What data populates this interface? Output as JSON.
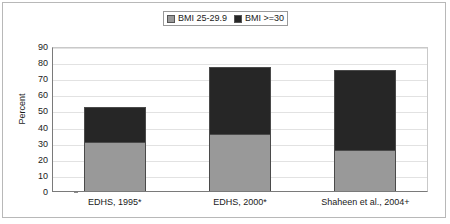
{
  "chart_data": {
    "type": "bar",
    "subtype": "stacked-bar",
    "title": "",
    "xlabel": "",
    "ylabel": "Percent",
    "ylim": [
      0,
      90
    ],
    "yticks": [
      0,
      10,
      20,
      30,
      40,
      50,
      60,
      70,
      80,
      90
    ],
    "grid": true,
    "legend_position": "top-center",
    "categories": [
      "EDHS, 1995*",
      "EDHS, 2000*",
      "Shaheen et al., 2004+"
    ],
    "series": [
      {
        "name": "BMI 25-29.9",
        "color": "#999999",
        "values": [
          31,
          36,
          26
        ]
      },
      {
        "name": "BMI >=30",
        "color": "#262626",
        "values": [
          21,
          41,
          49
        ]
      }
    ],
    "totals": [
      52,
      77,
      75
    ]
  },
  "legend": {
    "entries": [
      {
        "label": "BMI 25-29.9",
        "swatch": "legend-swatch-light",
        "color": "#999999"
      },
      {
        "label": "BMI >=30",
        "swatch": "legend-swatch-dark",
        "color": "#262626"
      }
    ]
  },
  "axes": {
    "y_title": "Percent",
    "y_ticks": [
      "90",
      "80",
      "70",
      "60",
      "50",
      "40",
      "30",
      "20",
      "10",
      "0"
    ],
    "x_labels": [
      "EDHS, 1995*",
      "EDHS, 2000*",
      "Shaheen et al., 2004+"
    ]
  },
  "colors": {
    "series_light": "#999999",
    "series_dark": "#262626",
    "plot_background": "#ffffff",
    "gridline": "#e2e2e2",
    "axis": "#7a7a7a",
    "frame": "#b8b8b8",
    "text": "#1a1a1a"
  }
}
